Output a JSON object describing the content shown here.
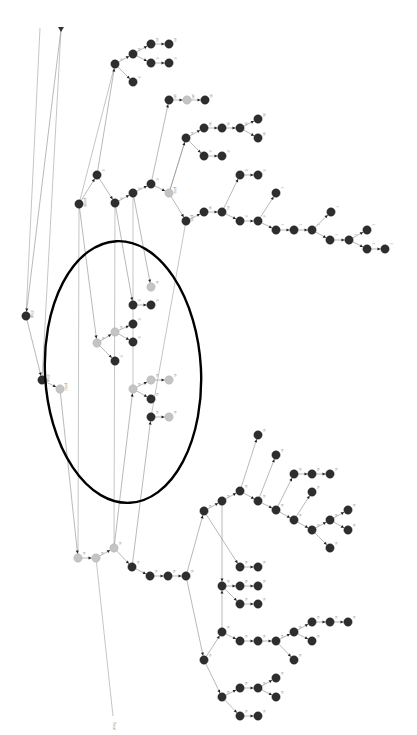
{
  "diagram": {
    "type": "rotated-tree-graph",
    "colors": {
      "dark_node": "#2e2e2e",
      "light_node": "#c4c4c4",
      "edge": "#8a8a8a",
      "highlight_ellipse": "#000000"
    },
    "highlight_ellipse": {
      "cx": 123,
      "cy": 372,
      "rx": 78,
      "ry": 131,
      "rotate": -3
    },
    "root_marker": {
      "x": 61,
      "y": 29
    },
    "nodes": [
      {
        "id": "a1",
        "x": 26,
        "y": 316,
        "t": "d",
        "l": "disp"
      },
      {
        "id": "a2",
        "x": 42,
        "y": 380,
        "t": "d",
        "l": "disp"
      },
      {
        "id": "a3",
        "x": 60,
        "y": 389,
        "t": "l",
        "l": "proj"
      },
      {
        "id": "b1",
        "x": 79,
        "y": 204,
        "t": "d",
        "l": "prob"
      },
      {
        "id": "b2",
        "x": 97,
        "y": 175,
        "t": "d",
        "l": "it"
      },
      {
        "id": "b3",
        "x": 115,
        "y": 203,
        "t": "d",
        "l": "it"
      },
      {
        "id": "b4",
        "x": 133,
        "y": 193,
        "t": "d",
        "l": "it"
      },
      {
        "id": "b5",
        "x": 151,
        "y": 184,
        "t": "d",
        "l": "it"
      },
      {
        "id": "b6",
        "x": 169,
        "y": 193,
        "t": "l",
        "l": "pro"
      },
      {
        "id": "b7",
        "x": 186,
        "y": 221,
        "t": "d",
        "l": "pro"
      },
      {
        "id": "c1",
        "x": 115,
        "y": 64,
        "t": "d",
        "l": "it"
      },
      {
        "id": "c2",
        "x": 133,
        "y": 54,
        "t": "d",
        "l": "n"
      },
      {
        "id": "c3",
        "x": 133,
        "y": 82,
        "t": "d",
        "l": "it"
      },
      {
        "id": "c4",
        "x": 151,
        "y": 44,
        "t": "d",
        "l": "m"
      },
      {
        "id": "c5",
        "x": 169,
        "y": 44,
        "t": "d",
        "l": "m"
      },
      {
        "id": "c6",
        "x": 151,
        "y": 63,
        "t": "d",
        "l": "it"
      },
      {
        "id": "c7",
        "x": 169,
        "y": 63,
        "t": "d",
        "l": "it"
      },
      {
        "id": "d1",
        "x": 169,
        "y": 100,
        "t": "d",
        "l": "sn"
      },
      {
        "id": "d2",
        "x": 187,
        "y": 100,
        "t": "l",
        "l": "sn"
      },
      {
        "id": "d3",
        "x": 205,
        "y": 100,
        "t": "d",
        "l": "in"
      },
      {
        "id": "e1",
        "x": 186,
        "y": 138,
        "t": "d",
        "l": "n"
      },
      {
        "id": "e2",
        "x": 204,
        "y": 128,
        "t": "d",
        "l": "in"
      },
      {
        "id": "e3",
        "x": 222,
        "y": 128,
        "t": "d",
        "l": "in"
      },
      {
        "id": "e4",
        "x": 240,
        "y": 128,
        "t": "d",
        "l": "in"
      },
      {
        "id": "e5",
        "x": 258,
        "y": 119,
        "t": "d",
        "l": "in"
      },
      {
        "id": "e6",
        "x": 258,
        "y": 138,
        "t": "d",
        "l": "in"
      },
      {
        "id": "e7",
        "x": 204,
        "y": 156,
        "t": "d",
        "l": "it"
      },
      {
        "id": "e8",
        "x": 222,
        "y": 156,
        "t": "d",
        "l": "it"
      },
      {
        "id": "f1",
        "x": 222,
        "y": 212,
        "t": "d",
        "l": "ni"
      },
      {
        "id": "f0",
        "x": 204,
        "y": 212,
        "t": "d",
        "l": "in"
      },
      {
        "id": "f2",
        "x": 240,
        "y": 175,
        "t": "d",
        "l": "it"
      },
      {
        "id": "f3",
        "x": 258,
        "y": 175,
        "t": "d",
        "l": "it"
      },
      {
        "id": "f4",
        "x": 240,
        "y": 221,
        "t": "d",
        "l": "it"
      },
      {
        "id": "f5",
        "x": 258,
        "y": 221,
        "t": "d",
        "l": "it"
      },
      {
        "id": "f6",
        "x": 276,
        "y": 193,
        "t": "d",
        "l": "t"
      },
      {
        "id": "f7",
        "x": 276,
        "y": 230,
        "t": "d",
        "l": "t"
      },
      {
        "id": "f8",
        "x": 294,
        "y": 230,
        "t": "d",
        "l": "t"
      },
      {
        "id": "f9",
        "x": 312,
        "y": 230,
        "t": "d",
        "l": "t"
      },
      {
        "id": "f10",
        "x": 331,
        "y": 212,
        "t": "d",
        "l": "t"
      },
      {
        "id": "f11",
        "x": 330,
        "y": 240,
        "t": "d",
        "l": "t"
      },
      {
        "id": "f12",
        "x": 349,
        "y": 240,
        "t": "d",
        "l": "t"
      },
      {
        "id": "f13",
        "x": 367,
        "y": 230,
        "t": "d",
        "l": "t"
      },
      {
        "id": "f14",
        "x": 367,
        "y": 249,
        "t": "d",
        "l": "t"
      },
      {
        "id": "f15",
        "x": 385,
        "y": 249,
        "t": "d",
        "l": "t"
      },
      {
        "id": "g1",
        "x": 97,
        "y": 343,
        "t": "l",
        "l": "n"
      },
      {
        "id": "g2",
        "x": 115,
        "y": 332,
        "t": "l",
        "l": "n"
      },
      {
        "id": "g3",
        "x": 115,
        "y": 361,
        "t": "d",
        "l": "it"
      },
      {
        "id": "g4",
        "x": 133,
        "y": 324,
        "t": "d",
        "l": "it"
      },
      {
        "id": "g5",
        "x": 133,
        "y": 342,
        "t": "d",
        "l": "it"
      },
      {
        "id": "g6",
        "x": 133,
        "y": 305,
        "t": "d",
        "l": "it"
      },
      {
        "id": "g7",
        "x": 151,
        "y": 305,
        "t": "d",
        "l": "it"
      },
      {
        "id": "g8",
        "x": 151,
        "y": 287,
        "t": "l",
        "l": "n"
      },
      {
        "id": "h1",
        "x": 133,
        "y": 389,
        "t": "l",
        "l": "n"
      },
      {
        "id": "h2",
        "x": 151,
        "y": 380,
        "t": "l",
        "l": "n"
      },
      {
        "id": "h3",
        "x": 151,
        "y": 399,
        "t": "d",
        "l": "n"
      },
      {
        "id": "h4",
        "x": 169,
        "y": 380,
        "t": "l",
        "l": "n"
      },
      {
        "id": "h5",
        "x": 151,
        "y": 417,
        "t": "d",
        "l": "n"
      },
      {
        "id": "h6",
        "x": 169,
        "y": 417,
        "t": "l",
        "l": "n"
      },
      {
        "id": "i1",
        "x": 78,
        "y": 558,
        "t": "l",
        "l": "n"
      },
      {
        "id": "i2",
        "x": 96,
        "y": 558,
        "t": "l",
        "l": "n"
      },
      {
        "id": "i3",
        "x": 114,
        "y": 548,
        "t": "l",
        "l": "n"
      },
      {
        "id": "i4",
        "x": 132,
        "y": 567,
        "t": "d",
        "l": "n"
      },
      {
        "id": "i5",
        "x": 150,
        "y": 576,
        "t": "d",
        "l": "n"
      },
      {
        "id": "i6",
        "x": 168,
        "y": 576,
        "t": "d",
        "l": "n"
      },
      {
        "id": "i7",
        "x": 186,
        "y": 576,
        "t": "d",
        "l": "n"
      },
      {
        "id": "j1",
        "x": 204,
        "y": 511,
        "t": "d",
        "l": "n"
      },
      {
        "id": "j2",
        "x": 222,
        "y": 501,
        "t": "d",
        "l": "n"
      },
      {
        "id": "j3",
        "x": 240,
        "y": 491,
        "t": "d",
        "l": "n"
      },
      {
        "id": "j4",
        "x": 258,
        "y": 435,
        "t": "d",
        "l": "n"
      },
      {
        "id": "j5",
        "x": 258,
        "y": 501,
        "t": "d",
        "l": "n"
      },
      {
        "id": "j6",
        "x": 276,
        "y": 455,
        "t": "d",
        "l": "n"
      },
      {
        "id": "j7",
        "x": 276,
        "y": 510,
        "t": "d",
        "l": "n"
      },
      {
        "id": "j8",
        "x": 294,
        "y": 474,
        "t": "d",
        "l": "n"
      },
      {
        "id": "j9",
        "x": 312,
        "y": 474,
        "t": "d",
        "l": "n"
      },
      {
        "id": "j10",
        "x": 330,
        "y": 474,
        "t": "d",
        "l": "n"
      },
      {
        "id": "j11",
        "x": 294,
        "y": 520,
        "t": "d",
        "l": "n"
      },
      {
        "id": "j12",
        "x": 312,
        "y": 492,
        "t": "d",
        "l": "n"
      },
      {
        "id": "j13",
        "x": 312,
        "y": 530,
        "t": "d",
        "l": "n"
      },
      {
        "id": "j14",
        "x": 330,
        "y": 520,
        "t": "d",
        "l": "n"
      },
      {
        "id": "j15",
        "x": 348,
        "y": 510,
        "t": "d",
        "l": "n"
      },
      {
        "id": "j16",
        "x": 348,
        "y": 530,
        "t": "d",
        "l": "n"
      },
      {
        "id": "j17",
        "x": 330,
        "y": 548,
        "t": "d",
        "l": "n"
      },
      {
        "id": "k1",
        "x": 240,
        "y": 567,
        "t": "d",
        "l": "n"
      },
      {
        "id": "k2",
        "x": 258,
        "y": 567,
        "t": "d",
        "l": "n"
      },
      {
        "id": "k3",
        "x": 222,
        "y": 586,
        "t": "d",
        "l": "n"
      },
      {
        "id": "k4",
        "x": 240,
        "y": 586,
        "t": "d",
        "l": "n"
      },
      {
        "id": "k5",
        "x": 258,
        "y": 586,
        "t": "d",
        "l": "n"
      },
      {
        "id": "k6",
        "x": 240,
        "y": 604,
        "t": "d",
        "l": "n"
      },
      {
        "id": "k7",
        "x": 258,
        "y": 604,
        "t": "d",
        "l": "n"
      },
      {
        "id": "m1",
        "x": 204,
        "y": 660,
        "t": "d",
        "l": "n"
      },
      {
        "id": "m2",
        "x": 222,
        "y": 632,
        "t": "d",
        "l": "n"
      },
      {
        "id": "m3",
        "x": 240,
        "y": 641,
        "t": "d",
        "l": "n"
      },
      {
        "id": "m4",
        "x": 258,
        "y": 641,
        "t": "d",
        "l": "n"
      },
      {
        "id": "m5",
        "x": 276,
        "y": 641,
        "t": "d",
        "l": "n"
      },
      {
        "id": "m6",
        "x": 294,
        "y": 632,
        "t": "d",
        "l": "n"
      },
      {
        "id": "m7",
        "x": 312,
        "y": 622,
        "t": "d",
        "l": "n"
      },
      {
        "id": "m8",
        "x": 330,
        "y": 622,
        "t": "d",
        "l": "n"
      },
      {
        "id": "m9",
        "x": 348,
        "y": 622,
        "t": "d",
        "l": "n"
      },
      {
        "id": "m10",
        "x": 312,
        "y": 641,
        "t": "d",
        "l": "n"
      },
      {
        "id": "m11",
        "x": 294,
        "y": 660,
        "t": "d",
        "l": "n"
      },
      {
        "id": "m12",
        "x": 222,
        "y": 697,
        "t": "d",
        "l": "n"
      },
      {
        "id": "m13",
        "x": 240,
        "y": 688,
        "t": "d",
        "l": "n"
      },
      {
        "id": "m14",
        "x": 258,
        "y": 688,
        "t": "d",
        "l": "n"
      },
      {
        "id": "m15",
        "x": 276,
        "y": 678,
        "t": "d",
        "l": "n"
      },
      {
        "id": "m16",
        "x": 276,
        "y": 697,
        "t": "d",
        "l": "n"
      },
      {
        "id": "m17",
        "x": 240,
        "y": 716,
        "t": "d",
        "l": "n"
      },
      {
        "id": "m18",
        "x": 258,
        "y": 716,
        "t": "d",
        "l": "n"
      }
    ],
    "edges": [
      [
        "R",
        "a1"
      ],
      [
        "a1",
        "a2"
      ],
      [
        "a2",
        "a3"
      ],
      [
        "b1",
        "b2"
      ],
      [
        "b2",
        "b3"
      ],
      [
        "b3",
        "b4"
      ],
      [
        "b4",
        "b5"
      ],
      [
        "b5",
        "b6"
      ],
      [
        "b6",
        "b7"
      ],
      [
        "b2",
        "c1"
      ],
      [
        "c1",
        "c2"
      ],
      [
        "c1",
        "c3"
      ],
      [
        "c2",
        "c4"
      ],
      [
        "c4",
        "c5"
      ],
      [
        "c2",
        "c6"
      ],
      [
        "c6",
        "c7"
      ],
      [
        "b5",
        "d1"
      ],
      [
        "d1",
        "d2"
      ],
      [
        "d2",
        "d3"
      ],
      [
        "b6",
        "e1"
      ],
      [
        "e1",
        "e2"
      ],
      [
        "e2",
        "e3"
      ],
      [
        "e3",
        "e4"
      ],
      [
        "e4",
        "e5"
      ],
      [
        "e4",
        "e6"
      ],
      [
        "e1",
        "e7"
      ],
      [
        "e7",
        "e8"
      ],
      [
        "b7",
        "f0"
      ],
      [
        "f0",
        "f1"
      ],
      [
        "f1",
        "f2"
      ],
      [
        "f2",
        "f3"
      ],
      [
        "f1",
        "f4"
      ],
      [
        "f4",
        "f5"
      ],
      [
        "f5",
        "f6"
      ],
      [
        "f5",
        "f7"
      ],
      [
        "f7",
        "f8"
      ],
      [
        "f8",
        "f9"
      ],
      [
        "f9",
        "f10"
      ],
      [
        "f9",
        "f11"
      ],
      [
        "f11",
        "f12"
      ],
      [
        "f12",
        "f13"
      ],
      [
        "f12",
        "f14"
      ],
      [
        "f14",
        "f15"
      ],
      [
        "b1",
        "g1"
      ],
      [
        "g1",
        "g2"
      ],
      [
        "g1",
        "g3"
      ],
      [
        "g2",
        "g4"
      ],
      [
        "g2",
        "g5"
      ],
      [
        "b3",
        "g6"
      ],
      [
        "g6",
        "g7"
      ],
      [
        "b4",
        "g8"
      ],
      [
        "i3",
        "h1"
      ],
      [
        "h1",
        "h2"
      ],
      [
        "h1",
        "h3"
      ],
      [
        "h2",
        "h4"
      ],
      [
        "i4",
        "h5"
      ],
      [
        "h5",
        "h6"
      ],
      [
        "a3",
        "i1"
      ],
      [
        "i1",
        "i2"
      ],
      [
        "i2",
        "i3"
      ],
      [
        "i3",
        "i4"
      ],
      [
        "i4",
        "i5"
      ],
      [
        "i5",
        "i6"
      ],
      [
        "i6",
        "i7"
      ],
      [
        "i7",
        "j1"
      ],
      [
        "j1",
        "j2"
      ],
      [
        "j2",
        "j3"
      ],
      [
        "j3",
        "j4"
      ],
      [
        "j3",
        "j5"
      ],
      [
        "j5",
        "j6"
      ],
      [
        "j5",
        "j7"
      ],
      [
        "j7",
        "j8"
      ],
      [
        "j8",
        "j9"
      ],
      [
        "j9",
        "j10"
      ],
      [
        "j7",
        "j11"
      ],
      [
        "j11",
        "j12"
      ],
      [
        "j11",
        "j13"
      ],
      [
        "j13",
        "j14"
      ],
      [
        "j14",
        "j15"
      ],
      [
        "j14",
        "j16"
      ],
      [
        "j13",
        "j17"
      ],
      [
        "j1",
        "k1"
      ],
      [
        "k1",
        "k2"
      ],
      [
        "j2",
        "k3"
      ],
      [
        "k3",
        "k4"
      ],
      [
        "k4",
        "k5"
      ],
      [
        "k3",
        "k6"
      ],
      [
        "k6",
        "k7"
      ],
      [
        "i7",
        "m1"
      ],
      [
        "m1",
        "m2"
      ],
      [
        "m2",
        "m3"
      ],
      [
        "m3",
        "m4"
      ],
      [
        "m4",
        "m5"
      ],
      [
        "m5",
        "m6"
      ],
      [
        "m6",
        "m7"
      ],
      [
        "m7",
        "m8"
      ],
      [
        "m8",
        "m9"
      ],
      [
        "m6",
        "m10"
      ],
      [
        "m5",
        "m11"
      ],
      [
        "m2",
        "k3"
      ],
      [
        "m1",
        "m12"
      ],
      [
        "m12",
        "m13"
      ],
      [
        "m13",
        "m14"
      ],
      [
        "m14",
        "m15"
      ],
      [
        "m14",
        "m16"
      ],
      [
        "m12",
        "m17"
      ],
      [
        "m17",
        "m18"
      ]
    ],
    "long_lines": [
      {
        "x1": 40,
        "y1": 28,
        "x2": 26,
        "y2": 316
      },
      {
        "x1": 61,
        "y1": 30,
        "x2": 42,
        "y2": 380
      },
      {
        "x1": 113,
        "y1": 716,
        "x2": 96,
        "y2": 558
      },
      {
        "x1": 79,
        "y1": 204,
        "x2": 78,
        "y2": 558
      },
      {
        "x1": 115,
        "y1": 203,
        "x2": 114,
        "y2": 548
      },
      {
        "x1": 186,
        "y1": 221,
        "x2": 151,
        "y2": 417
      },
      {
        "x1": 115,
        "y1": 64,
        "x2": 79,
        "y2": 204
      },
      {
        "x1": 133,
        "y1": 193,
        "x2": 133,
        "y2": 389
      },
      {
        "x1": 169,
        "y1": 193,
        "x2": 186,
        "y2": 138
      }
    ],
    "bottom_label": {
      "x": 113,
      "y": 722,
      "text": "fixal"
    }
  }
}
